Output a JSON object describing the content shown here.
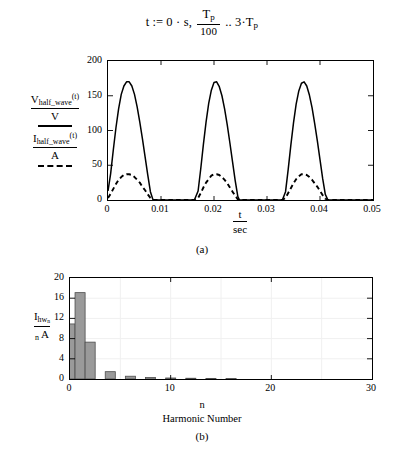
{
  "equation": {
    "lhs": "t",
    "assign": ":=",
    "first": "0 · s,",
    "frac_num": "T",
    "frac_num_sub": "p",
    "frac_den": "100",
    "range_dots": "..",
    "last_coef": "3",
    "last_dot": "·",
    "last_sym": "T",
    "last_sub": "p"
  },
  "top_chart": {
    "panel_tag": "(a)",
    "legend": [
      {
        "num_main": "V",
        "num_sub": "half_wave",
        "num_arg": "(t)",
        "den": "V",
        "style": "solid"
      },
      {
        "num_main": "I",
        "num_sub": "half_wave",
        "num_arg": "(t)",
        "den": "A",
        "style": "dashed"
      }
    ],
    "x_label_num": "t",
    "x_label_den": "sec",
    "y_ticks": [
      "0",
      "50",
      "100",
      "150",
      "200"
    ],
    "x_ticks": [
      "0",
      "0.01",
      "0.02",
      "0.03",
      "0.04",
      "0.05"
    ]
  },
  "bottom_chart": {
    "panel_tag": "(b)",
    "y_label_main": "I",
    "y_label_sub": "hw",
    "y_label_sub2": "n",
    "y_label_den_n": "n",
    "y_label_den_A": "A",
    "x_axis_title": "n",
    "x_axis_subtitle": "Harmonic Number",
    "y_ticks": [
      "0",
      "4",
      "8",
      "12",
      "16",
      "20"
    ],
    "x_ticks": [
      "0",
      "10",
      "20",
      "30"
    ]
  },
  "colors": {
    "line": "#000000",
    "bar_fill": "#9a9a9a",
    "bar_stroke": "#4d4d4d",
    "grid": "#f0f0f0",
    "background": "#ffffff"
  },
  "chart_data": [
    {
      "type": "line",
      "id": "half-wave-rectifier-waveforms",
      "title": "",
      "xlabel": "t/sec",
      "ylabel": "",
      "xlim": [
        0,
        0.05
      ],
      "ylim": [
        0,
        200
      ],
      "xticks": [
        0,
        0.01,
        0.02,
        0.03,
        0.04,
        0.05
      ],
      "yticks": [
        0,
        50,
        100,
        150,
        200
      ],
      "grid": false,
      "legend_position": "left-outside",
      "series": [
        {
          "name": "V_half_wave(t)/V",
          "linestyle": "solid",
          "x": [
            0,
            0.0005,
            0.001,
            0.0015,
            0.002,
            0.0025,
            0.003,
            0.0035,
            0.004,
            0.0045,
            0.005,
            0.0055,
            0.006,
            0.0065,
            0.007,
            0.0075,
            0.008,
            0.0085,
            0.009,
            0.0125,
            0.0163,
            0.017,
            0.0175,
            0.018,
            0.0185,
            0.019,
            0.0195,
            0.02,
            0.0205,
            0.021,
            0.0215,
            0.022,
            0.0225,
            0.023,
            0.0235,
            0.024,
            0.0245,
            0.0248,
            0.025,
            0.029,
            0.0329,
            0.0335,
            0.034,
            0.0345,
            0.035,
            0.0355,
            0.036,
            0.0365,
            0.037,
            0.0375,
            0.038,
            0.0385,
            0.039,
            0.0395,
            0.04,
            0.0405,
            0.041,
            0.0415,
            0.042,
            0.046,
            0.05
          ],
          "y": [
            13,
            38,
            72,
            104,
            131,
            152,
            164,
            170,
            170,
            164,
            152,
            134,
            112,
            88,
            62,
            36,
            12,
            0,
            0,
            0,
            0,
            13,
            45,
            80,
            112,
            139,
            158,
            169,
            170,
            163,
            150,
            131,
            108,
            82,
            55,
            28,
            5,
            0,
            0,
            0,
            0,
            12,
            44,
            79,
            111,
            138,
            157,
            168,
            170,
            164,
            151,
            133,
            110,
            85,
            58,
            31,
            8,
            0,
            0,
            0,
            0,
            0
          ]
        },
        {
          "name": "I_half_wave(t)/A",
          "linestyle": "dashed",
          "x": [
            0,
            0.0005,
            0.001,
            0.0015,
            0.002,
            0.0025,
            0.003,
            0.0035,
            0.004,
            0.0045,
            0.005,
            0.0055,
            0.006,
            0.0065,
            0.007,
            0.0075,
            0.008,
            0.0085,
            0.009,
            0.0125,
            0.0163,
            0.017,
            0.0175,
            0.018,
            0.0185,
            0.019,
            0.0195,
            0.02,
            0.0205,
            0.021,
            0.0215,
            0.022,
            0.0225,
            0.023,
            0.0235,
            0.024,
            0.0245,
            0.0248,
            0.025,
            0.029,
            0.0329,
            0.0335,
            0.034,
            0.0345,
            0.035,
            0.0355,
            0.036,
            0.0365,
            0.037,
            0.0375,
            0.038,
            0.0385,
            0.039,
            0.0395,
            0.04,
            0.0405,
            0.041,
            0.0415,
            0.042,
            0.046,
            0.05
          ],
          "y": [
            3,
            9,
            16,
            23,
            29,
            33,
            36,
            37,
            37,
            36,
            33,
            29,
            25,
            19,
            14,
            8,
            3,
            0,
            0,
            0,
            0,
            3,
            10,
            18,
            25,
            30,
            35,
            37,
            37,
            36,
            33,
            29,
            24,
            18,
            12,
            6,
            1,
            0,
            0,
            0,
            0,
            3,
            10,
            17,
            24,
            30,
            34,
            37,
            37,
            36,
            33,
            29,
            24,
            19,
            13,
            7,
            2,
            0,
            0,
            0,
            0,
            0
          ]
        }
      ]
    },
    {
      "type": "bar",
      "id": "harmonic-spectrum",
      "title": "",
      "xlabel": "Harmonic Number",
      "ylabel": "I_hw_n/A",
      "xlim": [
        0,
        30
      ],
      "ylim": [
        0,
        20
      ],
      "xticks": [
        0,
        10,
        20,
        30
      ],
      "yticks": [
        0,
        4,
        8,
        12,
        16,
        20
      ],
      "grid": true,
      "categories": [
        0,
        1,
        2,
        3,
        4,
        5,
        6,
        7,
        8,
        9,
        10,
        11,
        12,
        13,
        14,
        15,
        16,
        17,
        18,
        19,
        20
      ],
      "values": [
        10.9,
        17.1,
        7.3,
        0,
        1.45,
        0,
        0.55,
        0,
        0.3,
        0,
        0.2,
        0,
        0.15,
        0,
        0.12,
        0,
        0.1,
        0,
        0,
        0,
        0
      ]
    }
  ]
}
